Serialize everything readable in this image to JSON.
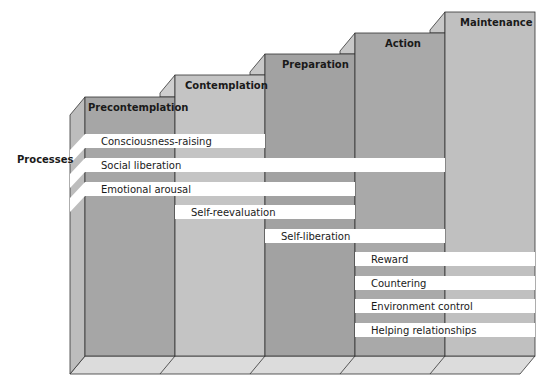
{
  "diagram": {
    "axis_label": "Processes",
    "stages": [
      {
        "label": "Precontemplation",
        "color": "#a6a6a6"
      },
      {
        "label": "Contemplation",
        "color": "#c4c4c4"
      },
      {
        "label": "Preparation",
        "color": "#a2a2a2"
      },
      {
        "label": "Action",
        "color": "#a9a9a9"
      },
      {
        "label": "Maintenance",
        "color": "#c0c0c0"
      }
    ],
    "processes": [
      {
        "label": "Consciousness-raising",
        "from_stage": 0,
        "to_stage": 1
      },
      {
        "label": "Social liberation",
        "from_stage": 0,
        "to_stage": 3
      },
      {
        "label": "Emotional arousal",
        "from_stage": 0,
        "to_stage": 2
      },
      {
        "label": "Self-reevaluation",
        "from_stage": 1,
        "to_stage": 2
      },
      {
        "label": "Self-liberation",
        "from_stage": 2,
        "to_stage": 3
      },
      {
        "label": "Reward",
        "from_stage": 3,
        "to_stage": 4
      },
      {
        "label": "Countering",
        "from_stage": 3,
        "to_stage": 4
      },
      {
        "label": "Environment control",
        "from_stage": 3,
        "to_stage": 4
      },
      {
        "label": "Helping relationships",
        "from_stage": 3,
        "to_stage": 4
      }
    ]
  }
}
